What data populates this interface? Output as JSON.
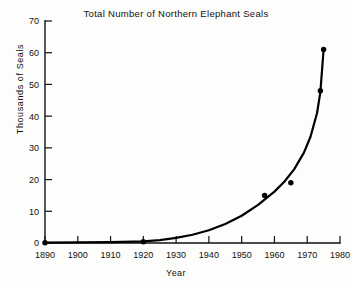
{
  "chart_data": {
    "type": "line",
    "title": "Total Number of Northern Elephant Seals",
    "xlabel": "Year",
    "ylabel": "Thousands of Seals",
    "xlim": [
      1890,
      1980
    ],
    "ylim": [
      0,
      70
    ],
    "xticks": [
      1890,
      1900,
      1910,
      1920,
      1930,
      1940,
      1950,
      1960,
      1970,
      1980
    ],
    "yticks": [
      0,
      10,
      20,
      30,
      40,
      50,
      60,
      70
    ],
    "grid": false,
    "legend": null,
    "series": [
      {
        "name": "Northern Elephant Seals",
        "marker": "filled-circle",
        "line": "solid-black",
        "x": [
          1890,
          1920,
          1957,
          1965,
          1974,
          1975
        ],
        "values": [
          0.1,
          0.4,
          15,
          19,
          48,
          61
        ]
      }
    ],
    "fitted_curve": {
      "description": "smooth exponential growth curve through points",
      "x": [
        1890,
        1900,
        1910,
        1920,
        1925,
        1930,
        1935,
        1940,
        1945,
        1950,
        1955,
        1960,
        1963,
        1966,
        1969,
        1971,
        1973,
        1974,
        1975
      ],
      "values": [
        0.1,
        0.2,
        0.3,
        0.5,
        0.9,
        1.6,
        2.6,
        4.0,
        6.0,
        8.6,
        12.0,
        16.2,
        19.3,
        23.2,
        28.5,
        33.5,
        41.0,
        47.5,
        61.0
      ]
    }
  },
  "axes": {
    "x_tick_labels": [
      "1890",
      "1900",
      "1910",
      "1920",
      "1930",
      "1940",
      "1950",
      "1960",
      "1970",
      "1980"
    ],
    "y_tick_labels": [
      "0",
      "10",
      "20",
      "30",
      "40",
      "50",
      "60",
      "70"
    ]
  }
}
